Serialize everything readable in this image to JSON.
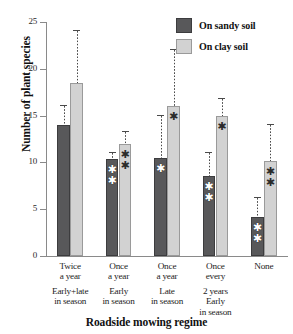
{
  "chart_data": {
    "type": "bar",
    "title": "",
    "xlabel": "Roadside mowing regime",
    "ylabel": "Number of plant species",
    "ylim": [
      0,
      25
    ],
    "yticks": [
      0,
      5,
      10,
      15,
      20,
      25
    ],
    "grid": false,
    "legend_position": "top-right",
    "categories": [
      "Twice a year Early+late in season",
      "Once a year Early in season",
      "Once a year Late in season",
      "Once every 2 years Early in season",
      "None"
    ],
    "category_lines": [
      [
        "Twice",
        "a year",
        "Early+late",
        "in season"
      ],
      [
        "Once",
        "a year",
        "Early",
        "in season"
      ],
      [
        "Once",
        "a year",
        "Late",
        "in season"
      ],
      [
        "Once",
        "every",
        "2 years",
        "Early",
        "in season"
      ],
      [
        "None"
      ]
    ],
    "series": [
      {
        "name": "On sandy soil",
        "color": "#58585a",
        "values": [
          14.0,
          10.4,
          10.5,
          8.6,
          4.2
        ],
        "error_upper": [
          16.0,
          11.0,
          15.0,
          11.0,
          6.2
        ],
        "significance": [
          "",
          "**",
          "*",
          "**",
          "**"
        ]
      },
      {
        "name": "On clay soil",
        "color": "#d2d2d2",
        "values": [
          18.5,
          12.0,
          16.0,
          15.0,
          10.2
        ],
        "error_upper": [
          24.0,
          13.3,
          22.0,
          16.8,
          14.0
        ],
        "significance": [
          "",
          "**",
          "*",
          "*",
          "**"
        ]
      }
    ]
  },
  "legend": {
    "items": [
      {
        "label": "On sandy soil",
        "swatch": "sandy"
      },
      {
        "label": "On clay soil",
        "swatch": "clay"
      }
    ]
  },
  "axis": {
    "y_title": "Number of plant species",
    "x_title": "Roadside mowing regime",
    "y_tick_labels": [
      "0",
      "5",
      "10",
      "15",
      "20",
      "25"
    ]
  }
}
